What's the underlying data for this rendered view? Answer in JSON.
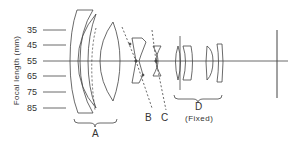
{
  "diagram": {
    "y_axis_label": "Focal length (mm)",
    "focal_lengths": [
      "35",
      "45",
      "55",
      "65",
      "75",
      "85"
    ],
    "groups": [
      {
        "label": "A",
        "note": ""
      },
      {
        "label": "B",
        "note": ""
      },
      {
        "label": "C",
        "note": ""
      },
      {
        "label": "D",
        "note": "(Fixed)"
      }
    ],
    "line_color": "#444444"
  }
}
